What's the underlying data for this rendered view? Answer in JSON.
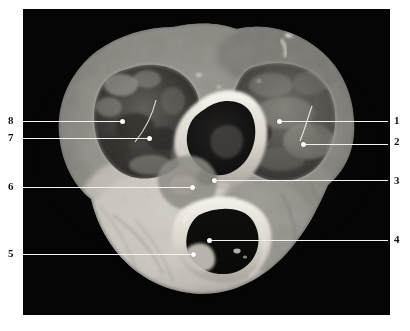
{
  "figure": {
    "plate_background": "#050505",
    "leader_color": "#f2f2f2",
    "label_color": "#111111",
    "caption": ""
  },
  "labels": {
    "left": [
      {
        "number": "8",
        "num_x": 8,
        "num_y": 115,
        "line_x": 22,
        "line_y": 121,
        "line_w": 98,
        "dot_x": 122,
        "dot_y": 121
      },
      {
        "number": "7",
        "num_x": 8,
        "num_y": 132,
        "line_x": 22,
        "line_y": 138,
        "line_w": 125,
        "dot_x": 149,
        "dot_y": 138
      },
      {
        "number": "6",
        "num_x": 8,
        "num_y": 181,
        "line_x": 22,
        "line_y": 187,
        "line_w": 168,
        "dot_x": 192,
        "dot_y": 187
      },
      {
        "number": "5",
        "num_x": 8,
        "num_y": 248,
        "line_x": 22,
        "line_y": 254,
        "line_w": 169,
        "dot_x": 193,
        "dot_y": 254
      }
    ],
    "right": [
      {
        "number": "1",
        "num_x": 396,
        "num_y": 115,
        "line_x": 281,
        "line_y": 121,
        "line_w": 107,
        "dot_x": 279,
        "dot_y": 121
      },
      {
        "number": "2",
        "num_x": 396,
        "num_y": 136,
        "line_x": 305,
        "line_y": 144,
        "line_w": 83,
        "dot_x": 303,
        "dot_y": 144
      },
      {
        "number": "3",
        "num_x": 396,
        "num_y": 175,
        "line_x": 216,
        "line_y": 180,
        "line_w": 172,
        "dot_x": 214,
        "dot_y": 180
      },
      {
        "number": "4",
        "num_x": 396,
        "num_y": 234,
        "line_x": 211,
        "line_y": 240,
        "line_w": 177,
        "dot_x": 209,
        "dot_y": 240
      }
    ]
  },
  "specimen": {
    "description": "Grayscale transverse section of a heart specimen showing two large chambers superiorly, a central chamber and an inferior dark chamber",
    "tone_light": "#d6d2cc",
    "tone_mid": "#8f8c88",
    "tone_dark": "#3a3835",
    "tone_cavity": "#111010"
  },
  "internal_threads": [
    {
      "name": "thread-left",
      "d": "M 152 116 C 148 126, 142 138, 134 150"
    },
    {
      "name": "thread-right",
      "d": "M 309 120 C 304 130, 300 142, 296 152"
    }
  ]
}
